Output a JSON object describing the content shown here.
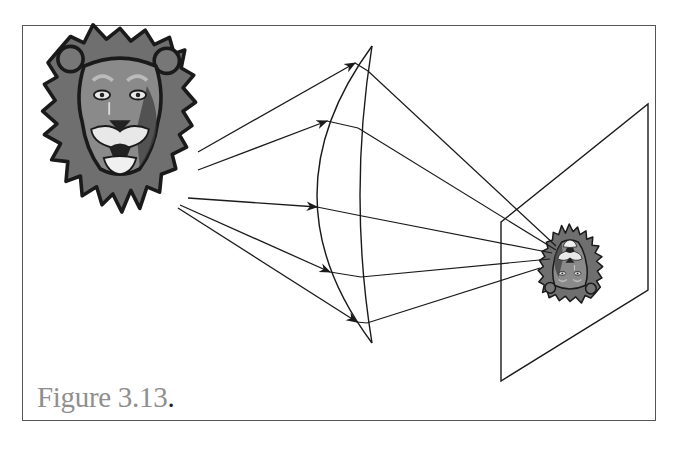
{
  "figure": {
    "caption_label": "Figure 3.13",
    "caption_period": "."
  },
  "elements": {
    "object": "lion-face (upright, large, left)",
    "lens": "plano-convex/biconvex lens (center)",
    "screen": "projection plane (right, perspective parallelogram)",
    "image": "lion-face (inverted, small, on screen)"
  },
  "rays": [
    {
      "id": 1,
      "label": "ray-1"
    },
    {
      "id": 2,
      "label": "ray-2"
    },
    {
      "id": 3,
      "label": "ray-3"
    },
    {
      "id": 4,
      "label": "ray-4"
    },
    {
      "id": 5,
      "label": "ray-5"
    }
  ],
  "colors": {
    "line": "#1a1a1a",
    "frame": "#555555",
    "caption": "#8f8f8f",
    "mane_dark": "#2a2a2a",
    "mane_mid": "#6f6f6f",
    "face": "#8a8a8a",
    "muzzle": "#e8e8e8"
  }
}
